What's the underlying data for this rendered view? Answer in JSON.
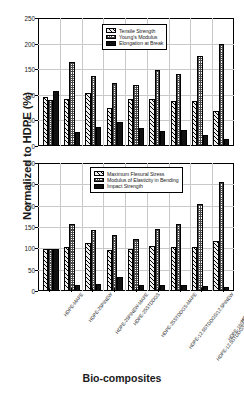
{
  "axis": {
    "y_title": "Normalized to HDPE (%)",
    "x_title": "Bio-composites"
  },
  "categories": [
    "HDPE-MAPE",
    "HDPE-25PINEW",
    "HDPE-25PINEW-MAPE",
    "HDPE-25STDDGS",
    "HDPE-25STDDGS-MAPE",
    "HDPE-12.5STDDGS/12.5PINEW",
    "HDPE-12.5STDDGS/12.5PINEW-MAPE",
    "HDPE-16STDDGS/9PINEW",
    "HDPE-40PINEW"
  ],
  "chart_data": [
    {
      "type": "bar",
      "id": "top",
      "title": "",
      "xlabel": "Bio-composites",
      "ylabel": "Normalized to HDPE (%)",
      "ylim": [
        0,
        250
      ],
      "yticks": [
        0,
        50,
        100,
        150,
        200,
        250
      ],
      "grid": true,
      "legend_position": "upper-center",
      "categories": [
        "HDPE-MAPE",
        "HDPE-25PINEW",
        "HDPE-25PINEW-MAPE",
        "HDPE-25STDDGS",
        "HDPE-25STDDGS-MAPE",
        "HDPE-12.5STDDGS/12.5PINEW",
        "HDPE-12.5STDDGS/12.5PINEW-MAPE",
        "HDPE-16STDDGS/9PINEW",
        "HDPE-40PINEW"
      ],
      "series": [
        {
          "name": "Tensile Strength",
          "pattern": "diagonal-hatch",
          "values": [
            96,
            91,
            104,
            75,
            92,
            92,
            87,
            87,
            69
          ]
        },
        {
          "name": "Young's Modulus",
          "pattern": "checkerboard",
          "values": [
            90,
            164,
            137,
            124,
            120,
            149,
            141,
            176,
            200
          ]
        },
        {
          "name": "Elongation at Break",
          "pattern": "solid-black",
          "values": [
            108,
            27,
            37,
            47,
            35,
            29,
            31,
            22,
            14
          ]
        }
      ]
    },
    {
      "type": "bar",
      "id": "bottom",
      "title": "",
      "xlabel": "Bio-composites",
      "ylabel": "Normalized to HDPE (%)",
      "ylim": [
        0,
        300
      ],
      "yticks": [
        0,
        50,
        100,
        150,
        200,
        250,
        300
      ],
      "grid": true,
      "legend_position": "upper-center",
      "categories": [
        "HDPE-MAPE",
        "HDPE-25PINEW",
        "HDPE-25PINEW-MAPE",
        "HDPE-25STDDGS",
        "HDPE-25STDDGS-MAPE",
        "HDPE-12.5STDDGS/12.5PINEW",
        "HDPE-12.5STDDGS/12.5PINEW-MAPE",
        "HDPE-16STDDGS/9PINEW",
        "HDPE-40PINEW"
      ],
      "series": [
        {
          "name": "Maximum Flexural Stress",
          "pattern": "diagonal-hatch",
          "values": [
            99,
            104,
            112,
            97,
            99,
            105,
            102,
            104,
            118
          ]
        },
        {
          "name": "Modulus of Elasticity in Bending",
          "pattern": "checkerboard",
          "values": [
            99,
            158,
            143,
            131,
            122,
            146,
            158,
            205,
            256
          ]
        },
        {
          "name": "Impact Strength",
          "pattern": "solid-black",
          "values": [
            98,
            14,
            16,
            34,
            15,
            15,
            14,
            11,
            10
          ]
        }
      ]
    }
  ],
  "legends": {
    "top": [
      {
        "label": "Tensile Strength",
        "pattern": "diagonal-hatch"
      },
      {
        "label": "Young's Modulus",
        "pattern": "checkerboard"
      },
      {
        "label": "Elongation at Break",
        "pattern": "solid-black"
      }
    ],
    "bottom": [
      {
        "label": "Maximum Flexural Stress",
        "pattern": "diagonal-hatch"
      },
      {
        "label": "Modulus of Elasticity in Bending",
        "pattern": "checkerboard"
      },
      {
        "label": "Impact Strength",
        "pattern": "solid-black"
      }
    ]
  }
}
